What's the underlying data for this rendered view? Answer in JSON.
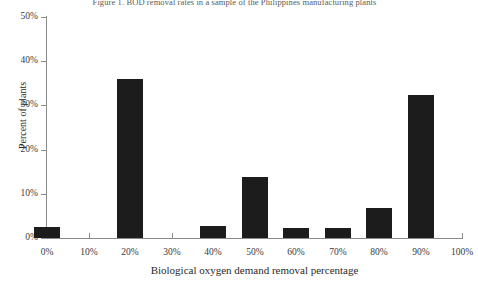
{
  "figure": {
    "title": "Figure 1. BOD removal rates in a sample of the Philippines manufacturing plants"
  },
  "chart_data": {
    "type": "bar",
    "title": "Figure 1. BOD removal rates in a sample of the Philippines manufacturing plants",
    "xlabel": "Biological oxygen demand removal percentage",
    "ylabel": "Percent of plants",
    "categories": [
      "0%",
      "10%",
      "20%",
      "30%",
      "40%",
      "50%",
      "60%",
      "70%",
      "80%",
      "90%",
      "100%"
    ],
    "values": [
      2.5,
      0,
      36.0,
      0,
      2.7,
      13.8,
      2.2,
      2.2,
      6.8,
      32.3,
      0
    ],
    "xlim": [
      0,
      100
    ],
    "ylim": [
      0,
      50
    ],
    "y_ticks": [
      "0%",
      "10%",
      "20%",
      "30%",
      "40%",
      "50%"
    ],
    "y_tick_values": [
      0,
      10,
      20,
      30,
      40,
      50
    ],
    "x_ticks": [
      "0%",
      "10%",
      "20%",
      "30%",
      "40%",
      "50%",
      "60%",
      "70%",
      "80%",
      "90%",
      "100%"
    ],
    "x_tick_values": [
      0,
      10,
      20,
      30,
      40,
      50,
      60,
      70,
      80,
      90,
      100
    ],
    "grid": false,
    "legend": false,
    "bar_color": "#1c1c1c",
    "axis_color": "#8a8a8a"
  }
}
